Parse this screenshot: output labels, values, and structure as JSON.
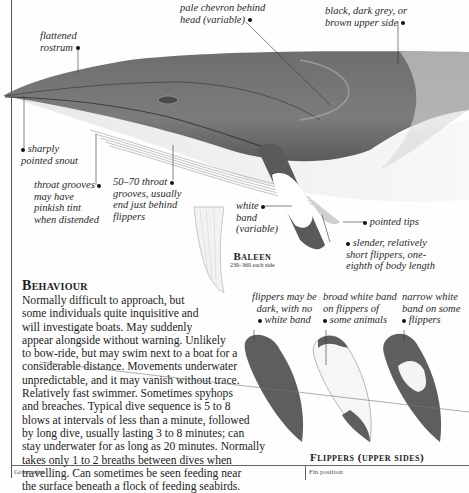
{
  "illustration": {
    "subject": "whale-side-view",
    "labels": {
      "flattened_rostrum": [
        "flattened",
        "rostrum"
      ],
      "pale_chevron": [
        "pale chevron behind",
        "head (variable)"
      ],
      "upper_side": [
        "black, dark grey, or",
        "brown upper side"
      ],
      "pointed_snout": [
        "sharply",
        "pointed snout"
      ],
      "throat_grooves_tint": [
        "throat grooves",
        "may have",
        "pinkish tint",
        "when distended"
      ],
      "throat_grooves_count": [
        "50–70 throat",
        "grooves, usually",
        "end just behind",
        "flippers"
      ],
      "white_band": [
        "white",
        "band",
        "(variable)"
      ],
      "pointed_tips": "pointed tips",
      "slender_flippers": [
        "slender, relatively",
        "short flippers, one-",
        "eighth of body length"
      ]
    }
  },
  "baleen": {
    "title": "Baleen",
    "subtitle": "230–360 each side"
  },
  "behaviour": {
    "heading": "Behaviour",
    "lines": [
      "Normally difficult to approach, but",
      "some individuals quite inquisitive and",
      "will investigate boats. May suddenly",
      "appear alongside without warning. Unlikely",
      "to bow-ride, but may swim next to a boat for a",
      "considerable distance. Movements underwater",
      "unpredictable, and it may vanish without trace.",
      "Relatively fast swimmer. Sometimes spyhops",
      "and breaches. Typical dive sequence is 5 to 8",
      "blows at intervals of less than a minute, followed",
      "by long dive, usually lasting 3 to 8 minutes; can",
      "stay underwater for as long as 20 minutes. Normally",
      "takes only 1 to 2 breaths between dives when",
      "travelling. Can sometimes be seen feeding near",
      "the surface beneath a flock of feeding seabirds."
    ]
  },
  "flippers": {
    "caption": "Flippers (upper sides)",
    "variants": [
      {
        "label": [
          "flippers may be",
          "dark, with no",
          "white band"
        ]
      },
      {
        "label": [
          "broad white band",
          "on flippers of",
          "some animals"
        ]
      },
      {
        "label": [
          "narrow white",
          "band on some",
          "flippers"
        ]
      }
    ]
  },
  "footer": {
    "left": "Group size",
    "right": "Fin position"
  },
  "colors": {
    "whale_dark": "#5a5a5c",
    "whale_mid": "#8a8a8c",
    "belly": "#f4f4f4",
    "text": "#222222"
  }
}
